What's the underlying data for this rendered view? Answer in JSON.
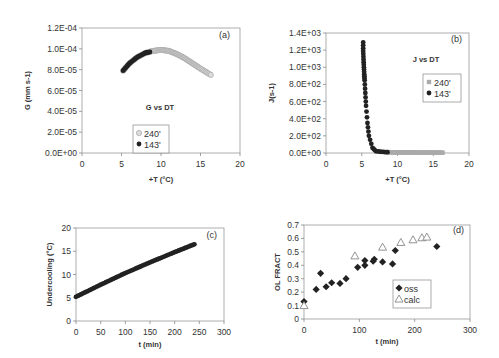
{
  "chart_data": [
    {
      "id": "a",
      "type": "scatter",
      "panel_label": "(a)",
      "title": "G vs DT",
      "xlabel": "+T (°C)",
      "ylabel": "G (mm s-1)",
      "xlim": [
        0,
        20
      ],
      "ylim": [
        0,
        0.00012
      ],
      "x_ticks": [
        "0",
        "5",
        "10",
        "15",
        "20"
      ],
      "y_ticks": [
        "0.0E+00",
        "2.0E-05",
        "4.0E-05",
        "6.0E-05",
        "8.0E-05",
        "1.0E-04",
        "1.2E-04"
      ],
      "legend": [
        "240'",
        "143'"
      ],
      "series": [
        {
          "name": "240'",
          "marker": "open-circle",
          "color": "#aaaaaa",
          "x": [
            5.2,
            6,
            7,
            8,
            9,
            10,
            11,
            12,
            13,
            14,
            15,
            16.3
          ],
          "y": [
            7.9e-05,
            8.6e-05,
            9.2e-05,
            9.6e-05,
            9.8e-05,
            9.9e-05,
            9.8e-05,
            9.5e-05,
            9.1e-05,
            8.6e-05,
            8.1e-05,
            7.5e-05
          ]
        },
        {
          "name": "143'",
          "marker": "filled-circle",
          "color": "#222222",
          "x": [
            5.2,
            6,
            7,
            8,
            8.6
          ],
          "y": [
            7.9e-05,
            8.6e-05,
            9.2e-05,
            9.6e-05,
            9.7e-05
          ]
        }
      ]
    },
    {
      "id": "b",
      "type": "scatter",
      "panel_label": "(b)",
      "title": "J vs DT",
      "xlabel": "+T (°C)",
      "ylabel": "J(s-1)",
      "xlim": [
        0,
        20
      ],
      "ylim": [
        0,
        1400
      ],
      "x_ticks": [
        "0",
        "5",
        "10",
        "15",
        "20"
      ],
      "y_ticks": [
        "0.0E+00",
        "2.0E+02",
        "4.0E+02",
        "6.0E+02",
        "8.0E+02",
        "1.0E+03",
        "1.2E+03",
        "1.4E+03"
      ],
      "legend": [
        "240'",
        "143'"
      ],
      "series": [
        {
          "name": "240'",
          "marker": "square",
          "color": "#aaaaaa",
          "x": [
            8.6,
            10,
            12,
            14,
            16.3
          ],
          "y": [
            10,
            8,
            6,
            5,
            4
          ]
        },
        {
          "name": "143'",
          "marker": "filled-circle",
          "color": "#222222",
          "x": [
            5.2,
            5.2,
            5.25,
            5.3,
            5.35,
            5.4,
            5.5,
            5.6,
            5.8,
            6,
            6.5,
            7,
            8,
            8.6
          ],
          "y": [
            1290,
            1190,
            1090,
            1000,
            920,
            850,
            700,
            550,
            350,
            200,
            60,
            20,
            12,
            10
          ]
        }
      ]
    },
    {
      "id": "c",
      "type": "scatter",
      "panel_label": "(c)",
      "title": "",
      "xlabel": "t (min)",
      "ylabel": "Undercooling (°C)",
      "xlim": [
        0,
        300
      ],
      "ylim": [
        0,
        20
      ],
      "x_ticks": [
        "0",
        "50",
        "100",
        "150",
        "200",
        "250",
        "300"
      ],
      "y_ticks": [
        "0",
        "5",
        "10",
        "15",
        "20"
      ],
      "series": [
        {
          "name": "undercooling",
          "marker": "filled-circle",
          "color": "#222222",
          "x": [
            0,
            50,
            100,
            150,
            200,
            240
          ],
          "y": [
            5.2,
            7.8,
            10.3,
            12.6,
            14.8,
            16.5
          ]
        }
      ]
    },
    {
      "id": "d",
      "type": "scatter",
      "panel_label": "(d)",
      "title": "",
      "xlabel": "t (min)",
      "ylabel": "OL FRACT",
      "xlim": [
        0,
        300
      ],
      "ylim": [
        0,
        0.7
      ],
      "x_ticks": [
        "0",
        "100",
        "200",
        "300"
      ],
      "y_ticks": [
        "0",
        "0.1",
        "0.2",
        "0.3",
        "0.4",
        "0.5",
        "0.6",
        "0.7"
      ],
      "legend": [
        "oss",
        "calc"
      ],
      "series": [
        {
          "name": "oss",
          "marker": "filled-diamond",
          "color": "#222222",
          "x": [
            0,
            22,
            30,
            40,
            50,
            65,
            76,
            97,
            110,
            110,
            125,
            127,
            142,
            160,
            165,
            240
          ],
          "y": [
            0.13,
            0.22,
            0.34,
            0.24,
            0.27,
            0.265,
            0.3,
            0.385,
            0.4,
            0.435,
            0.43,
            0.445,
            0.425,
            0.41,
            0.51,
            0.54
          ]
        },
        {
          "name": "calc",
          "marker": "open-triangle",
          "color": "#888888",
          "x": [
            0,
            92,
            142,
            175,
            197,
            213,
            222
          ],
          "y": [
            0.1,
            0.47,
            0.535,
            0.57,
            0.59,
            0.605,
            0.61
          ]
        }
      ]
    }
  ]
}
